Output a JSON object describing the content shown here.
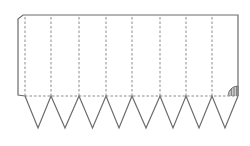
{
  "diagram": {
    "type": "paper-net-template",
    "panel_count": 8,
    "triangle_count": 8,
    "colors": {
      "stroke": "#6b6b6b",
      "fold_line": "#8a8a8a",
      "background": "#ffffff"
    },
    "geometry": {
      "top_y": 15,
      "fold_y": 96,
      "apex_y": 128,
      "left_x": 18,
      "right_x": 238,
      "panel_edges_x": [
        25,
        51,
        79,
        106,
        132,
        160,
        186,
        212,
        238
      ]
    },
    "glue_mark": "hatched-quarter-circle"
  }
}
